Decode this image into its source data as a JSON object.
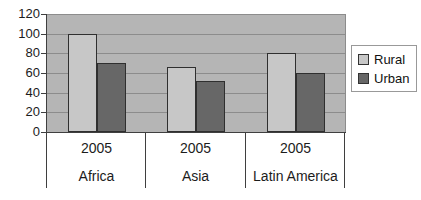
{
  "chart_data": {
    "type": "bar",
    "title": "",
    "categories": [
      "Africa",
      "Asia",
      "Latin America"
    ],
    "category_year_labels": [
      "2005",
      "2005",
      "2005"
    ],
    "series": [
      {
        "name": "Rural",
        "color": "#c7c7c7",
        "values": [
          100,
          66,
          80
        ]
      },
      {
        "name": "Urban",
        "color": "#676767",
        "values": [
          70,
          52,
          60
        ]
      }
    ],
    "xlabel": "",
    "ylabel": "",
    "ylim": [
      0,
      120
    ],
    "yticks": [
      0,
      20,
      40,
      60,
      80,
      100,
      120
    ],
    "grid": true,
    "legend_position": "right",
    "colors": {
      "plot_background": "#b5b5b5",
      "gridline": "#8c8c8c",
      "axis": "#3f3f3f",
      "bar_border": "#2f2f2f",
      "text": "#1c1c1c",
      "legend_border": "#999999",
      "background": "#ffffff"
    }
  }
}
